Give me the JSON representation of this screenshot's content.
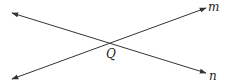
{
  "diagram": {
    "type": "intersecting-lines",
    "stroke_color": "#333333",
    "lines": [
      {
        "name": "m",
        "label": "m",
        "from": [
          12,
          79
        ],
        "to": [
          206,
          8
        ],
        "arrows": "both"
      },
      {
        "name": "n",
        "label": "n",
        "from": [
          12,
          13
        ],
        "to": [
          206,
          73
        ],
        "arrows": "both"
      }
    ],
    "intersection": {
      "label": "Q",
      "point": [
        110,
        43
      ]
    }
  }
}
